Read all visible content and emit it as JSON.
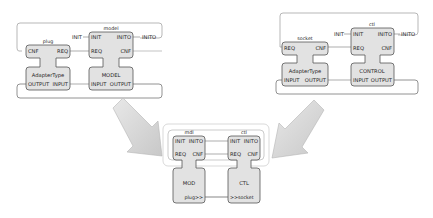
{
  "colors": {
    "block_fill": "#e2e2e2",
    "block_stroke": "#555555",
    "loop_stroke": "#9a9a9a",
    "arrow_fill": "#d6d6d6",
    "arrow_stroke": "#b5b5b5"
  },
  "left_diagram": {
    "plug": {
      "instance": "plug",
      "events_left": "CNF",
      "events_right": "REQ",
      "type": "AdapterType",
      "data_left": "OUTPUT",
      "data_right": "INPUT"
    },
    "model": {
      "instance": "model",
      "ext_in": "INIT",
      "ext_out": "INITO",
      "events_left_1": "INIT",
      "events_right_1": "INITO",
      "events_left_2": "REQ",
      "events_right_2": "CNF",
      "type": "MODEL",
      "data_left": "INPUT",
      "data_right": "OUTPUT"
    }
  },
  "right_diagram": {
    "socket": {
      "instance": "socket",
      "events_left": "REQ",
      "events_right": "CNF",
      "type": "AdapterType",
      "data_left": "INPUT",
      "data_right": "OUTPUT"
    },
    "ctl": {
      "instance": "ctl",
      "ext_in": "INIT",
      "ext_out": "INITO",
      "events_left_1": "INIT",
      "events_right_1": "INITO",
      "events_left_2": "REQ",
      "events_right_2": "CNF",
      "type": "CONTROL",
      "data_left": "INPUT",
      "data_right": "OUTPUT"
    }
  },
  "bottom_diagram": {
    "mdl": {
      "instance": "mdl",
      "events_left_1": "INIT",
      "events_right_1": "INITO",
      "events_left_2": "REQ",
      "events_right_2": "CNF",
      "type": "MOD",
      "adapter_right": "plug>>"
    },
    "ctl": {
      "instance": "ctl",
      "events_left_1": "INIT",
      "events_right_1": "INITO",
      "events_left_2": "REQ",
      "events_right_2": "CNF",
      "type": "CTL",
      "adapter_left": ">>socket"
    }
  }
}
